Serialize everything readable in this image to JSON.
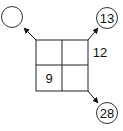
{
  "diagram": {
    "grid": {
      "rows": 2,
      "cols": 2,
      "cells": [
        [
          "",
          ""
        ],
        [
          "9",
          ""
        ]
      ],
      "side_label": "12"
    },
    "circles": [
      {
        "position": "top-left",
        "value": ""
      },
      {
        "position": "top-right",
        "value": "13"
      },
      {
        "position": "bottom-right",
        "value": "28"
      }
    ]
  }
}
